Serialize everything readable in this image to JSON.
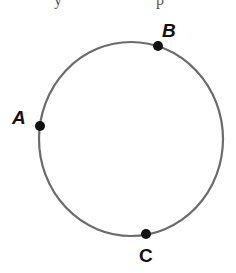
{
  "figure": {
    "type": "circle-with-points",
    "stroke_color": "#6b6b6b",
    "point_color": "#111111",
    "circle": {
      "cx": 131,
      "cy": 139,
      "rx": 92,
      "ry": 97
    },
    "points": [
      {
        "name": "A",
        "label": "A",
        "x": 40,
        "y": 126,
        "label_x": 12,
        "label_y": 124,
        "italic": true
      },
      {
        "name": "B",
        "label": "B",
        "x": 158,
        "y": 46,
        "label_x": 162,
        "label_y": 37,
        "italic": true
      },
      {
        "name": "C",
        "label": "C",
        "x": 146,
        "y": 234,
        "label_x": 139,
        "label_y": 262,
        "italic": false
      }
    ]
  },
  "header_fragment": {
    "left": "y",
    "right": "p"
  }
}
